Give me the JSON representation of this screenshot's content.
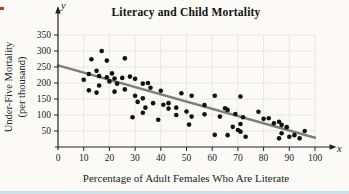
{
  "figure": {
    "title": "Literacy and Child Mortality",
    "xlabel": "Percentage of Adult Females Who Are Literate",
    "ylabel_line1": "Under-Five Mortality",
    "ylabel_line2": "(per thousand)",
    "x_axis_letter": "x",
    "y_axis_letter": "y"
  },
  "chart_data": {
    "type": "scatter",
    "title": "Literacy and Child Mortality",
    "xlabel": "Percentage of Adult Females Who Are Literate",
    "ylabel": "Under-Five Mortality (per thousand)",
    "xlim": [
      0,
      100
    ],
    "ylim": [
      0,
      350
    ],
    "x_ticks": [
      0,
      10,
      20,
      30,
      40,
      50,
      60,
      70,
      80,
      90,
      100
    ],
    "y_ticks": [
      50,
      100,
      150,
      200,
      250,
      300,
      350
    ],
    "grid": true,
    "legend": "none",
    "points": [
      [
        10,
        210
      ],
      [
        12,
        228
      ],
      [
        12,
        177
      ],
      [
        13,
        274
      ],
      [
        15,
        238
      ],
      [
        15,
        170
      ],
      [
        16,
        222
      ],
      [
        16,
        192
      ],
      [
        17,
        300
      ],
      [
        19,
        270
      ],
      [
        19,
        218
      ],
      [
        20,
        205
      ],
      [
        21,
        230
      ],
      [
        22,
        214
      ],
      [
        22,
        173
      ],
      [
        23,
        198
      ],
      [
        25,
        216
      ],
      [
        26,
        277
      ],
      [
        26,
        180
      ],
      [
        28,
        220
      ],
      [
        29,
        93
      ],
      [
        30,
        213
      ],
      [
        30,
        160
      ],
      [
        31,
        141
      ],
      [
        33,
        198
      ],
      [
        33,
        152
      ],
      [
        33,
        107
      ],
      [
        34,
        123
      ],
      [
        35,
        200
      ],
      [
        36,
        185
      ],
      [
        37,
        137
      ],
      [
        39,
        85
      ],
      [
        40,
        176
      ],
      [
        41,
        132
      ],
      [
        43,
        120
      ],
      [
        43,
        137
      ],
      [
        46,
        123
      ],
      [
        46,
        100
      ],
      [
        48,
        168
      ],
      [
        50,
        111
      ],
      [
        51,
        70
      ],
      [
        52,
        160
      ],
      [
        52,
        95
      ],
      [
        57,
        131
      ],
      [
        57,
        102
      ],
      [
        61,
        160
      ],
      [
        61,
        38
      ],
      [
        63,
        95
      ],
      [
        65,
        121
      ],
      [
        66,
        116
      ],
      [
        66,
        37
      ],
      [
        68,
        63
      ],
      [
        69,
        103
      ],
      [
        70,
        53
      ],
      [
        71,
        158
      ],
      [
        71,
        48
      ],
      [
        71,
        72
      ],
      [
        72,
        93
      ],
      [
        73,
        32
      ],
      [
        78,
        110
      ],
      [
        80,
        88
      ],
      [
        82,
        90
      ],
      [
        84,
        74
      ],
      [
        86,
        79
      ],
      [
        86,
        27
      ],
      [
        87,
        69
      ],
      [
        87,
        43
      ],
      [
        89,
        62
      ],
      [
        90,
        32
      ],
      [
        92,
        37
      ],
      [
        94,
        27
      ],
      [
        96,
        50
      ]
    ],
    "trend_line": {
      "x1": 0,
      "y1": 255,
      "x2": 100,
      "y2": 29
    },
    "colors": {
      "point": "#111111",
      "trend": "#7d7d7d",
      "axis": "#222222",
      "grid": "#e2e2e2",
      "background": "#fbfaf7",
      "page_edge": "#cfdfe6",
      "red_mark": "#c0392b"
    }
  }
}
